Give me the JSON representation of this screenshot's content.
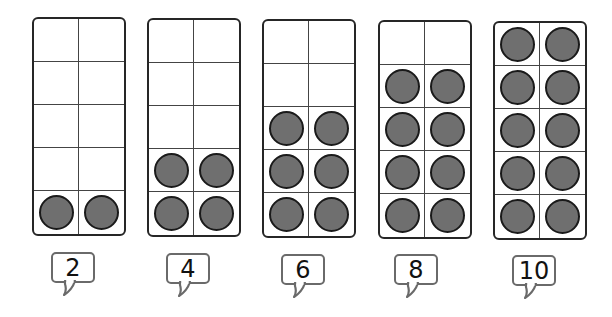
{
  "colors": {
    "counter_fill": "#6f6f6f",
    "counter_stroke": "#1a1a1a",
    "frame_border": "#262626",
    "bubble_border": "#6a6a6a"
  },
  "frames": [
    {
      "filled": 2,
      "label": "2"
    },
    {
      "filled": 4,
      "label": "4"
    },
    {
      "filled": 6,
      "label": "6"
    },
    {
      "filled": 8,
      "label": "8"
    },
    {
      "filled": 10,
      "label": "10"
    }
  ]
}
